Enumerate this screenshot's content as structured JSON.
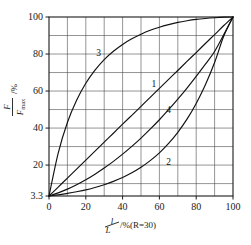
{
  "chart_data": {
    "type": "line",
    "title": "",
    "subtitle": "",
    "xlabel": "l/L/%(R=30)",
    "xlabel_parts": {
      "numerator": "l",
      "denominator": "L",
      "suffix": "/%(R=30)"
    },
    "ylabel": "F/Fmax /%",
    "ylabel_parts": {
      "numerator": "F",
      "denominator": "F",
      "denominator_sub": "max",
      "suffix": "/%"
    },
    "xlim": [
      0,
      100
    ],
    "ylim": [
      3.3,
      100
    ],
    "y_axis_bottom_value": 3.3,
    "grid": true,
    "grid_step_x": 10,
    "grid_step_y": 10,
    "legend": "none",
    "xticks": [
      0,
      20,
      40,
      60,
      80,
      100
    ],
    "xticklabels": [
      "0",
      "20",
      "40",
      "60",
      "80",
      "100"
    ],
    "yticks": [
      3.3,
      20,
      40,
      60,
      80,
      100
    ],
    "yticklabels": [
      "3.3",
      "20",
      "40",
      "60",
      "80",
      "100"
    ],
    "x": [
      0,
      5,
      10,
      15,
      20,
      25,
      30,
      35,
      40,
      45,
      50,
      55,
      60,
      65,
      70,
      75,
      80,
      85,
      90,
      95,
      100
    ],
    "series": [
      {
        "name": "1",
        "label": "1",
        "description": "linear characteristic",
        "label_x": 57,
        "label_y": 64,
        "values": [
          3.3,
          8.1,
          13.0,
          17.8,
          22.7,
          27.5,
          32.4,
          37.2,
          42.1,
          46.9,
          51.7,
          56.6,
          61.4,
          66.3,
          71.1,
          76.0,
          80.8,
          85.7,
          90.5,
          95.4,
          100
        ]
      },
      {
        "name": "2",
        "label": "2",
        "description": "equal-percentage characteristic",
        "label_x": 65,
        "label_y": 22,
        "values": [
          3.3,
          3.9,
          4.7,
          5.6,
          6.6,
          7.9,
          9.4,
          11.2,
          13.3,
          15.8,
          18.8,
          22.4,
          26.6,
          31.7,
          37.7,
          44.8,
          53.3,
          63.4,
          75.4,
          89.7,
          100
        ]
      },
      {
        "name": "3",
        "label": "3",
        "description": "quick-opening characteristic",
        "label_x": 27,
        "label_y": 81,
        "values": [
          3.3,
          26.5,
          43.0,
          55.0,
          64.2,
          71.3,
          77.0,
          81.5,
          85.2,
          88.2,
          90.7,
          92.8,
          94.5,
          95.9,
          97.1,
          98.0,
          98.7,
          99.2,
          99.6,
          99.9,
          100
        ]
      },
      {
        "name": "4",
        "label": "4",
        "description": "modified parabolic characteristic",
        "label_x": 65,
        "label_y": 50,
        "values": [
          3.3,
          5.0,
          7.0,
          9.4,
          12.1,
          15.1,
          18.4,
          22.0,
          25.9,
          30.1,
          34.6,
          39.4,
          44.5,
          49.9,
          55.6,
          61.6,
          67.9,
          74.5,
          81.4,
          90.5,
          100
        ]
      }
    ]
  }
}
